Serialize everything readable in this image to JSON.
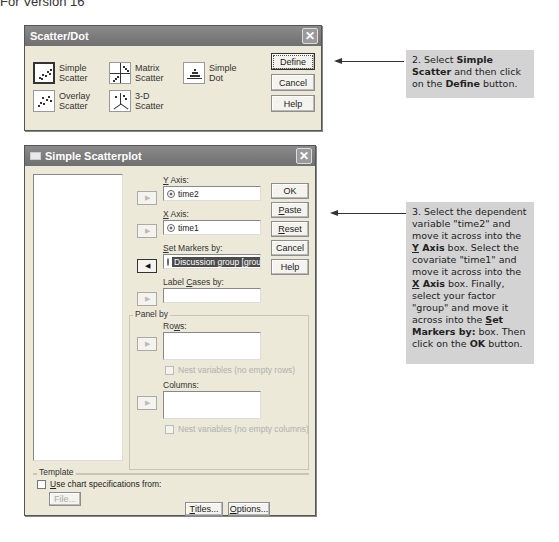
{
  "page_header": "For Version 16",
  "dialog1": {
    "title": "Scatter/Dot",
    "chart_types": [
      {
        "id": "simple-scatter",
        "line1": "Simple",
        "line2": "Scatter",
        "selected": true
      },
      {
        "id": "matrix-scatter",
        "line1": "Matrix",
        "line2": "Scatter",
        "selected": false
      },
      {
        "id": "simple-dot",
        "line1": "Simple",
        "line2": "Dot",
        "selected": false
      },
      {
        "id": "overlay-scatter",
        "line1": "Overlay",
        "line2": "Scatter",
        "selected": false
      },
      {
        "id": "3d-scatter",
        "line1": "3-D",
        "line2": "Scatter",
        "selected": false
      }
    ],
    "buttons": {
      "define": "Define",
      "cancel": "Cancel",
      "help": "Help"
    }
  },
  "dialog2": {
    "title": "Simple Scatterplot",
    "y_axis": {
      "label_u": "Y",
      "label_rest": " Axis:",
      "value": "time2"
    },
    "x_axis": {
      "label_u": "X",
      "label_rest": " Axis:",
      "value": "time1"
    },
    "set_markers": {
      "label_u": "S",
      "label_rest": "et Markers by:",
      "value": "Discussion group [group"
    },
    "label_cases": {
      "label_pre": "Label ",
      "label_u": "C",
      "label_rest": "ases by:",
      "value": ""
    },
    "panel_by": {
      "title": "Panel by",
      "rows": {
        "label_pre": "Ro",
        "label_u": "w",
        "label_rest": "s:",
        "nest": "Nest variables (no empty rows)"
      },
      "columns": {
        "label": "Columns:",
        "nest": "Nest variables (no empty columns)"
      }
    },
    "template": {
      "title": "Template",
      "use_chart_u": "U",
      "use_chart_rest": "se chart specifications from:",
      "file_button": "File..."
    },
    "buttons": {
      "ok": "OK",
      "paste_u": "P",
      "paste_rest": "aste",
      "reset_u": "R",
      "reset_rest": "eset",
      "cancel": "Cancel",
      "help": "Help",
      "titles_u": "T",
      "titles_rest": "itles...",
      "options_u": "O",
      "options_rest": "ptions..."
    }
  },
  "callouts": {
    "step2": {
      "pre": "2. Select ",
      "b1": "Simple Scatter",
      "mid": " and then click on the ",
      "b2": "Define",
      "post": " button."
    },
    "step3": {
      "p1": "3. Select the dependent variable \"time2\" and move it across into the ",
      "b1u": "Y",
      "b1": " Axis",
      "p2": " box. Select the covariate \"time1\" and move it across into the ",
      "b2u": "X",
      "b2": " Axis",
      "p3": " box. Finally, select your factor \"group\" and move it across into the ",
      "b3u": "S",
      "b3": "et Markers by:",
      "p4": " box. Then click on the ",
      "b4": "OK",
      "p5": " button."
    }
  }
}
